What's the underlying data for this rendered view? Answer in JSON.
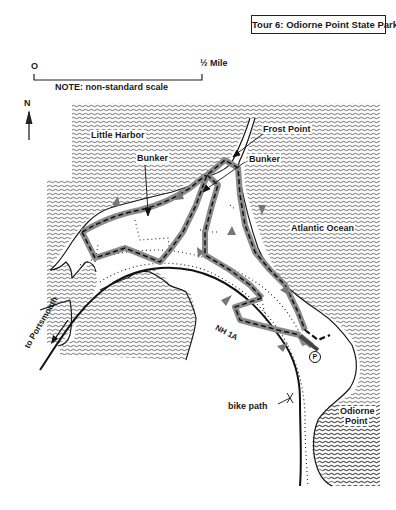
{
  "title": "Tour 6: Odiorne Point State Park",
  "scale": {
    "start_label": "O",
    "end_label": "½ Mile",
    "note": "NOTE: non-standard scale"
  },
  "compass": {
    "label": "N",
    "icon": "north-arrow-icon"
  },
  "labels": {
    "little_harbor": "Little Harbor",
    "frost_point": "Frost Point",
    "bunker_left": "Bunker",
    "bunker_right": "Bunker",
    "atlantic_ocean": "Atlantic Ocean",
    "to_portsmouth": "to Portsmouth",
    "road": "NH 1A",
    "bike_path": "bike path",
    "odiorne_point_line1": "Odiorne",
    "odiorne_point_line2": "Point",
    "parking": "P"
  },
  "legend_styles": {
    "water": "wavy horizontal hatching",
    "tour_route": "grey band with dashed black center",
    "trails": "dotted lines",
    "road": "solid black line"
  },
  "colors": {
    "ink": "#1a1a1a",
    "route_band": "#8a8a8a",
    "background": "#ffffff"
  }
}
